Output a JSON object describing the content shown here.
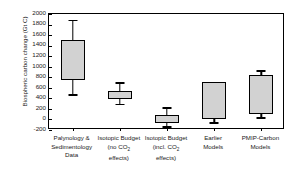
{
  "chart_data": {
    "type": "box",
    "title": "",
    "xlabel": "",
    "ylabel": "Biospheric carbon change (Gt C)",
    "ylim": [
      -200,
      2000
    ],
    "ytick_step": 200,
    "yticks": [
      2000,
      1800,
      1600,
      1400,
      1200,
      1000,
      800,
      600,
      400,
      200,
      0,
      -200
    ],
    "ytick_labels": [
      "2000",
      "1800",
      "1600",
      "1400",
      "1200",
      "1000",
      "800",
      "600",
      "400",
      "200",
      "0",
      "-200"
    ],
    "grid": false,
    "legend": false,
    "box_fill_color": "#d2d2d2",
    "line_color": "#000000",
    "categories": [
      "Palynology & Sedimentology Data",
      "Isotopic Budget (no CO2 effects)",
      "Isotopic Budget (incl. CO2 effects)",
      "Earlier Models",
      "PMIP-Carbon Models"
    ],
    "category_label_lines": [
      [
        "Palynology &",
        "Sedimentology",
        "Data"
      ],
      [
        "Isotopic Budget",
        "(no CO",
        "effects)"
      ],
      [
        "Isotopic Budget",
        "(incl. CO",
        "effects)"
      ],
      [
        "Earlier",
        "Models"
      ],
      [
        "PMIP-Carbon",
        "Models"
      ]
    ],
    "boxes": [
      {
        "category": "Palynology & Sedimentology Data",
        "whisker_low": 480,
        "box_low": 740,
        "box_high": 1500,
        "whisker_high": 1890
      },
      {
        "category": "Isotopic Budget (no CO2 effects)",
        "whisker_low": 300,
        "box_low": 390,
        "box_high": 545,
        "whisker_high": 710
      },
      {
        "category": "Isotopic Budget (incl. CO2 effects)",
        "whisker_low": -130,
        "box_low": -60,
        "box_high": 90,
        "whisker_high": 235
      },
      {
        "category": "Earlier Models",
        "whisker_low": -55,
        "box_low": 0,
        "box_high": 710,
        "whisker_high": 710
      },
      {
        "category": "PMIP-Carbon Models",
        "whisker_low": 45,
        "box_low": 110,
        "box_high": 850,
        "whisker_high": 935
      }
    ],
    "units": "Gt C",
    "subscript_text": "2"
  }
}
